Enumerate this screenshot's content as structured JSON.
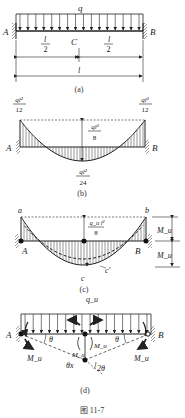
{
  "panel_a": {
    "load_label": "q",
    "left_support": "A",
    "right_support": "B",
    "mid_label": "C",
    "half_num_left": "l",
    "half_den_left": "2",
    "half_num_right": "l",
    "half_den_right": "2",
    "span_label": "l",
    "caption": "(a)"
  },
  "panel_b": {
    "left_end_num": "ql²",
    "left_end_den": "12",
    "right_end_num": "ql²",
    "right_end_den": "12",
    "mid_height_num": "ql²",
    "mid_height_den": "8",
    "mid_moment_num": "ql²",
    "mid_moment_den": "24",
    "left_support": "A",
    "right_support": "B",
    "caption": "(b)"
  },
  "panel_c": {
    "point_a": "a",
    "point_b": "b",
    "point_c": "c",
    "point_c_prime": "c'",
    "left_support": "A",
    "right_support": "B",
    "mid_height_num": "q_u l²",
    "mid_height_den": "8",
    "moment_top": "M_u",
    "moment_bottom": "M_u",
    "caption": "(c)"
  },
  "panel_d": {
    "load_label": "q_u",
    "left_support": "A",
    "right_support": "B",
    "theta_left": "θ",
    "theta_right": "θ",
    "two_theta": "2θ",
    "deflection": "θx",
    "mu_left": "M_u",
    "mu_right": "M_u",
    "mu_mid_left": "M_u",
    "mu_mid_right": "M_u",
    "caption": "(d)"
  },
  "figure_caption": "图 11-7"
}
